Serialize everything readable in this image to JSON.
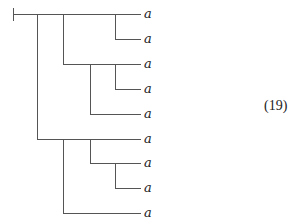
{
  "diagram": {
    "type": "dendrogram",
    "equation_number": "(19)",
    "line_color": "#555555",
    "root": {
      "x": 13,
      "y": 14,
      "tick_top": 8,
      "tick_bottom": 21
    },
    "leaf_end_x": 141,
    "label_x": 144,
    "leaves": [
      {
        "label": "a",
        "y": 14
      },
      {
        "label": "a",
        "y": 39
      },
      {
        "label": "a",
        "y": 64
      },
      {
        "label": "a",
        "y": 89
      },
      {
        "label": "a",
        "y": 114
      },
      {
        "label": "a",
        "y": 139
      },
      {
        "label": "a",
        "y": 163
      },
      {
        "label": "a",
        "y": 188
      },
      {
        "label": "a",
        "y": 213
      }
    ],
    "branches": [
      {
        "x": 37,
        "y_from": 14,
        "y_to": 139
      },
      {
        "x": 63,
        "y_from": 14,
        "y_to": 64
      },
      {
        "x": 115,
        "y_from": 14,
        "y_to": 39
      },
      {
        "x": 90,
        "y_from": 64,
        "y_to": 114
      },
      {
        "x": 115,
        "y_from": 64,
        "y_to": 89
      },
      {
        "x": 63,
        "y_from": 139,
        "y_to": 213
      },
      {
        "x": 90,
        "y_from": 139,
        "y_to": 163
      },
      {
        "x": 115,
        "y_from": 163,
        "y_to": 188
      }
    ]
  }
}
